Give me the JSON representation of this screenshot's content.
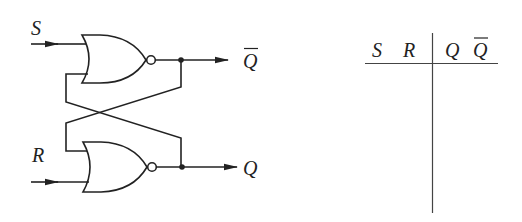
{
  "diagram": {
    "inputs": [
      {
        "label": "S",
        "gate": "top"
      },
      {
        "label": "R",
        "gate": "bottom"
      }
    ],
    "outputs": [
      {
        "label": "Q",
        "overline": true,
        "gate": "top"
      },
      {
        "label": "Q",
        "overline": false,
        "gate": "bottom"
      }
    ],
    "gates": [
      {
        "type": "NOR",
        "position": "top"
      },
      {
        "type": "NOR",
        "position": "bottom"
      }
    ]
  },
  "truth_table": {
    "input_headers": [
      "S",
      "R"
    ],
    "output_headers": [
      {
        "label": "Q",
        "overline": false
      },
      {
        "label": "Q",
        "overline": true
      }
    ],
    "rows": []
  },
  "colors": {
    "ink": "#222222",
    "background": "#ffffff"
  }
}
